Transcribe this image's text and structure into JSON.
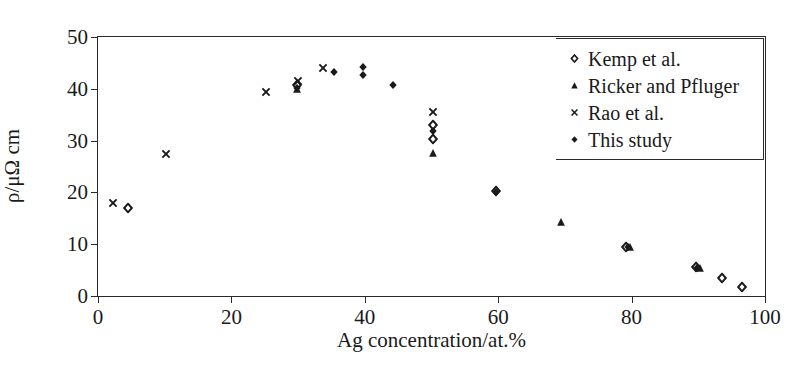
{
  "chart_data": {
    "type": "scatter",
    "title": "",
    "xlabel": "Ag concentration/at.%",
    "ylabel": "ρ/μΩ cm",
    "xlim": [
      0,
      100
    ],
    "ylim": [
      0,
      50
    ],
    "xticks": [
      0,
      20,
      40,
      60,
      80,
      100
    ],
    "yticks": [
      0,
      10,
      20,
      30,
      40,
      50
    ],
    "xtick_labels": [
      "0",
      "20",
      "40",
      "60",
      "80",
      "100"
    ],
    "ytick_labels": [
      "0",
      "10",
      "20",
      "30",
      "40",
      "50"
    ],
    "grid": false,
    "legend_position": "top-right",
    "series": [
      {
        "name": "Kemp et al.",
        "marker": "open-diamond",
        "color": "#1a1a1a",
        "points": [
          {
            "x": 4.5,
            "y": 17.0
          },
          {
            "x": 29.8,
            "y": 40.7
          },
          {
            "x": 50.2,
            "y": 33.0
          },
          {
            "x": 50.2,
            "y": 30.3
          },
          {
            "x": 59.6,
            "y": 20.3
          },
          {
            "x": 79.2,
            "y": 9.5
          },
          {
            "x": 89.6,
            "y": 5.6
          },
          {
            "x": 93.6,
            "y": 3.4
          },
          {
            "x": 96.6,
            "y": 1.8
          }
        ]
      },
      {
        "name": "Ricker and Pfluger",
        "marker": "filled-triangle",
        "color": "#1a1a1a",
        "points": [
          {
            "x": 29.8,
            "y": 39.9
          },
          {
            "x": 50.2,
            "y": 27.6
          },
          {
            "x": 69.4,
            "y": 14.2
          },
          {
            "x": 79.8,
            "y": 9.4
          },
          {
            "x": 90.2,
            "y": 5.4
          }
        ]
      },
      {
        "name": "Rao et al.",
        "marker": "cross",
        "color": "#1a1a1a",
        "points": [
          {
            "x": 2.2,
            "y": 18.0
          },
          {
            "x": 10.2,
            "y": 27.4
          },
          {
            "x": 25.2,
            "y": 39.3
          },
          {
            "x": 30.0,
            "y": 41.5
          },
          {
            "x": 33.8,
            "y": 44.1
          },
          {
            "x": 50.2,
            "y": 35.5
          }
        ]
      },
      {
        "name": "This study",
        "marker": "filled-diamond",
        "color": "#1a1a1a",
        "points": [
          {
            "x": 29.8,
            "y": 40.2
          },
          {
            "x": 35.4,
            "y": 43.3
          },
          {
            "x": 39.8,
            "y": 44.3
          },
          {
            "x": 39.8,
            "y": 42.6
          },
          {
            "x": 44.2,
            "y": 40.8
          },
          {
            "x": 50.2,
            "y": 31.8
          },
          {
            "x": 59.6,
            "y": 20.0
          },
          {
            "x": 79.4,
            "y": 9.5
          },
          {
            "x": 89.8,
            "y": 5.5
          }
        ]
      }
    ]
  }
}
